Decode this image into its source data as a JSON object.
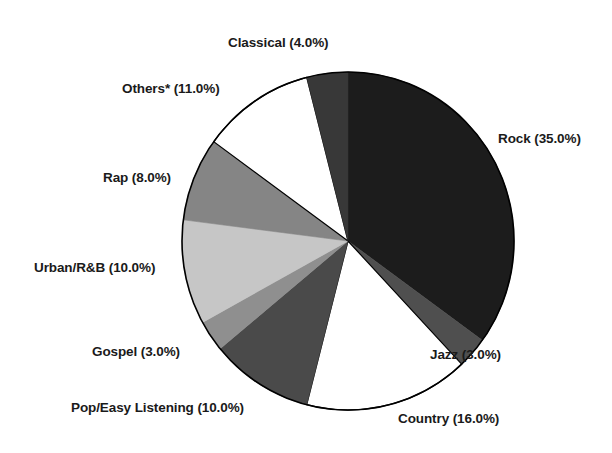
{
  "chart_data": {
    "type": "pie",
    "title": "",
    "subtitle": "",
    "xlabel": "",
    "ylabel": "",
    "legend_position": "none",
    "grid": false,
    "label_format": "{name} ({value}%)",
    "start_angle_deg": 0,
    "direction": "clockwise",
    "categories": [
      "Rock",
      "Jazz",
      "Country",
      "Pop/Easy Listening",
      "Gospel",
      "Urban/R&B",
      "Rap",
      "Others*",
      "Classical"
    ],
    "values": [
      35.0,
      3.0,
      16.0,
      10.0,
      3.0,
      10.0,
      8.0,
      11.0,
      4.0
    ],
    "total": 100.0,
    "slices": [
      {
        "name": "Rock",
        "value": 35.0,
        "label": "Rock (35.0%)",
        "color": "#1c1c1c"
      },
      {
        "name": "Jazz",
        "value": 3.0,
        "label": "Jazz (3.0%)",
        "color": "#4f4f4f"
      },
      {
        "name": "Country",
        "value": 16.0,
        "label": "Country (16.0%)",
        "color": "#ffffff"
      },
      {
        "name": "Pop/Easy Listening",
        "value": 10.0,
        "label": "Pop/Easy Listening (10.0%)",
        "color": "#4a4a4a"
      },
      {
        "name": "Gospel",
        "value": 3.0,
        "label": "Gospel (3.0%)",
        "color": "#8f8f8f"
      },
      {
        "name": "Urban/R&B",
        "value": 10.0,
        "label": "Urban/R&B (10.0%)",
        "color": "#c6c6c6"
      },
      {
        "name": "Rap",
        "value": 8.0,
        "label": "Rap (8.0%)",
        "color": "#858585"
      },
      {
        "name": "Others*",
        "value": 11.0,
        "label": "Others* (11.0%)",
        "color": "#ffffff"
      },
      {
        "name": "Classical",
        "value": 4.0,
        "label": "Classical (4.0%)",
        "color": "#383838"
      }
    ],
    "geometry": {
      "center_x": 348,
      "center_y": 241,
      "radius_x": 166,
      "radius_y": 169,
      "outline_color": "#000000",
      "outline_width": 1.6
    }
  },
  "labels": {
    "classical": "Classical (4.0%)",
    "others": "Others* (11.0%)",
    "rap": "Rap (8.0%)",
    "urban": "Urban/R&B (10.0%)",
    "gospel": "Gospel (3.0%)",
    "pop": "Pop/Easy Listening (10.0%)",
    "country": "Country (16.0%)",
    "jazz": "Jazz (3.0%)",
    "rock": "Rock (35.0%)"
  }
}
